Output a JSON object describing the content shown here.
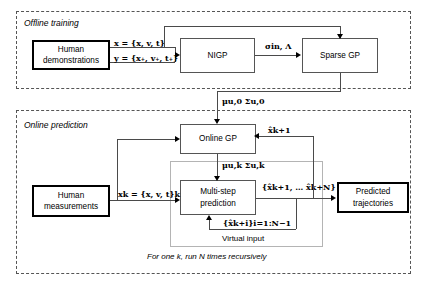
{
  "diagram": {
    "sections": [
      {
        "id": "offline",
        "label": "Offline training"
      },
      {
        "id": "online",
        "label": "Online prediction"
      }
    ],
    "boxes": {
      "human_demonstrations": "Human\ndemonstrations",
      "human_demonstrations_line1": "Human",
      "human_demonstrations_line2": "demonstrations",
      "nigp": "NIGP",
      "sparse_gp": "Sparse GP",
      "online_gp": "Online GP",
      "human_measurements_line1": "Human",
      "human_measurements_line2": "measurements",
      "multi_step_line1": "Multi-step",
      "multi_step_line2": "prediction",
      "predicted_line1": "Predicted",
      "predicted_line2": "trajectories"
    },
    "labels": {
      "x_input": "x = {x, v, t}",
      "y_input": "y = {x₊, v₊, t₊}",
      "sigma_lambda": "σin, Λ",
      "mu_sigma_u0": "μu,0 Σu,0",
      "mu_sigma_uk": "μu,k Σu,k",
      "x_k": "xk = {x, v, t}k",
      "x_hat_k1": "x̂k+1",
      "x_hat_set": "{x̂k+1, … x̂k+N}",
      "virtual_feedback": "{x̂k+i}i=1:N−1",
      "virtual_input": "Virtual input",
      "recursion_note": "For one k, run N times recursively"
    },
    "colors": {
      "line": "#4a4a4a",
      "grey_line": "#9a9a9a",
      "box_border_thick": "#000000",
      "box_border_thin": "#555555",
      "dashed_border": "#555555",
      "background": "#ffffff"
    }
  }
}
